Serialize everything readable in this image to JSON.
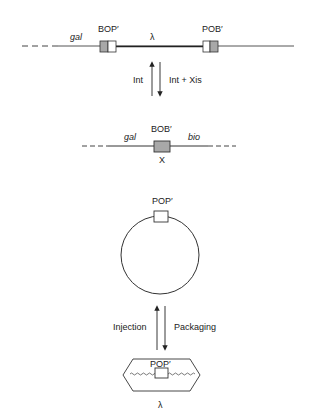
{
  "diagram": {
    "type": "lambda-phage-integration-excision-cycle",
    "colors": {
      "line": "#333333",
      "box_fill_gray": "#a8a8a8",
      "box_fill_white": "#ffffff",
      "text": "#222222"
    },
    "integrated_prophage": {
      "left_flank_label": "gal",
      "left_site_label": "BOP′",
      "middle_label": "λ",
      "right_site_label": "POB′"
    },
    "reaction_1": {
      "up_arrow_label": "Int",
      "down_arrow_label": "Int + Xis"
    },
    "bacterial_chromosome": {
      "left_flank_label": "gal",
      "site_label": "BOB′",
      "right_flank_label": "bio",
      "core_label": "X"
    },
    "circular_phage": {
      "site_label": "POP′"
    },
    "reaction_2": {
      "up_arrow_label": "Injection",
      "down_arrow_label": "Packaging"
    },
    "phage_particle": {
      "site_label": "POP′",
      "particle_label": "λ"
    }
  }
}
